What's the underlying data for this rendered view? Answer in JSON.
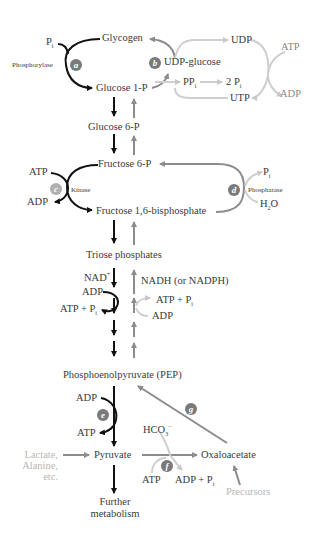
{
  "diagram": {
    "metabolites": {
      "glycogen": "Glycogen",
      "udp_glucose": "UDP-glucose",
      "udp": "UDP",
      "utp": "UTP",
      "glucose_1p": "Glucose 1-P",
      "ppi": "PP",
      "ppi_sub": "i",
      "two_pi": "2 P",
      "two_pi_sub": "i",
      "glucose_6p": "Glucose 6-P",
      "fructose_6p": "Fructose 6-P",
      "fructose_16bp": "Fructose 1,6-bisphosphate",
      "triose_phosphates": "Triose phosphates",
      "pep": "Phosphoenolpyruvate (PEP)",
      "pyruvate": "Pyruvate",
      "oxaloacetate": "Oxaloacetate",
      "further_metabolism_1": "Further",
      "further_metabolism_2": "metabolism",
      "lactate_1": "Lactate,",
      "lactate_2": "Alanine,",
      "lactate_3": "etc.",
      "precursors": "Precursors"
    },
    "cofactors": {
      "pi_top": "P",
      "pi_top_sub": "i",
      "atp_top_right": "ATP",
      "adp_top_right": "ADP",
      "atp_kinase": "ATP",
      "adp_kinase": "ADP",
      "pi_phosphatase": "P",
      "pi_phosphatase_sub": "i",
      "h2o": "H",
      "h2o_sub": "2",
      "h2o_end": "O",
      "nad": "NAD",
      "nad_sup": "+",
      "nadh": "NADH (or NADPH)",
      "adp_glycolysis": "ADP",
      "atp_pi_glycolysis": "ATP + P",
      "atp_pi_glycolysis_sub": "i",
      "atp_pi_gluconeo": "ATP + P",
      "atp_pi_gluconeo_sub": "i",
      "adp_gluconeo": "ADP",
      "adp_pk": "ADP",
      "atp_pk": "ATP",
      "hco3": "HCO",
      "hco3_sub": "3",
      "hco3_sup": "−",
      "atp_pc": "ATP",
      "adp_pi_pc": "ADP + P",
      "adp_pi_pc_sub": "i"
    },
    "enzymes": {
      "phosphorylase": "Phosphorylase",
      "kinase": "Kinase",
      "phosphatase": "Phosphatase"
    },
    "badges": [
      "a",
      "b",
      "c",
      "d",
      "e",
      "f",
      "g"
    ],
    "colors": {
      "glycolysis_arrow": "#111111",
      "gluconeogenesis_arrow": "#8c8c8c",
      "synthesis_light": "#c8c8c8",
      "badge_dark": "#7a7a7a",
      "text": "#3a3a3a"
    }
  }
}
